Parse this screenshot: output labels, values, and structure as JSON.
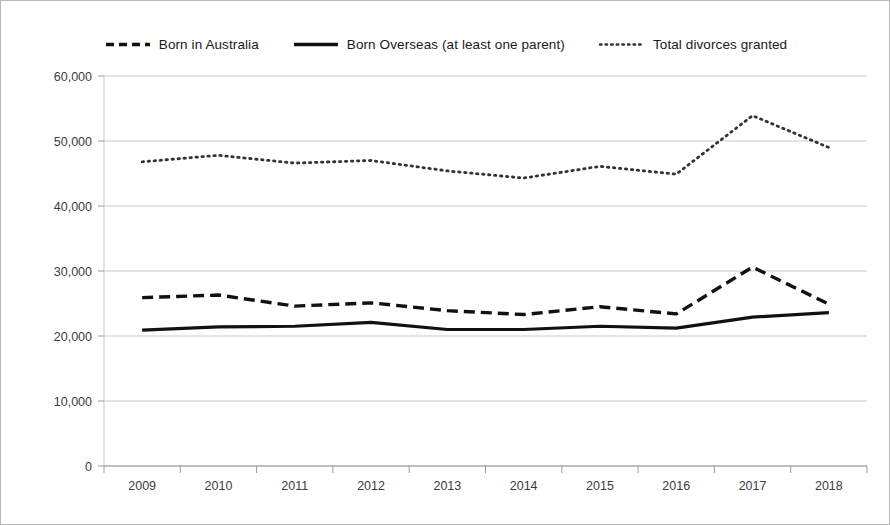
{
  "chart_data": {
    "type": "line",
    "title": "",
    "subtitle": "",
    "xlabel": "",
    "ylabel": "",
    "categories": [
      "2009",
      "2010",
      "2011",
      "2012",
      "2013",
      "2014",
      "2015",
      "2016",
      "2017",
      "2018"
    ],
    "x": [
      2009,
      2010,
      2011,
      2012,
      2013,
      2014,
      2015,
      2016,
      2017,
      2018
    ],
    "ylim": [
      0,
      60000
    ],
    "ytick_labels": [
      "0",
      "10,000",
      "20,000",
      "30,000",
      "40,000",
      "50,000",
      "60,000"
    ],
    "ytick_values": [
      0,
      10000,
      20000,
      30000,
      40000,
      50000,
      60000
    ],
    "grid": true,
    "grid_axis": "y",
    "legend_position": "top",
    "series": [
      {
        "name": "Born in Australia",
        "style": "dashed",
        "color": "#111111",
        "values": [
          25900,
          26300,
          24600,
          25100,
          23900,
          23300,
          24500,
          23400,
          30600,
          24900
        ]
      },
      {
        "name": "Born Overseas (at least one parent)",
        "style": "solid",
        "color": "#111111",
        "values": [
          20900,
          21400,
          21500,
          22100,
          21000,
          21000,
          21500,
          21200,
          22900,
          23600
        ]
      },
      {
        "name": "Total divorces granted",
        "style": "dotted",
        "color": "#333333",
        "values": [
          46800,
          47800,
          46600,
          47000,
          45400,
          44300,
          46100,
          44900,
          53900,
          49000
        ]
      }
    ]
  }
}
